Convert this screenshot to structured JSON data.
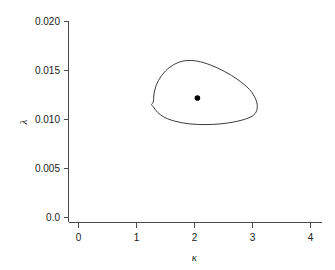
{
  "chart_data": {
    "type": "line",
    "title": "",
    "subtitle": "",
    "xlabel": "κ",
    "ylabel": "λ",
    "xlim": [
      -0.17,
      4.35
    ],
    "ylim": [
      -0.0005,
      0.0205
    ],
    "grid": false,
    "legend": null,
    "x_ticks": [
      0,
      1,
      2,
      3,
      4
    ],
    "x_tick_labels": [
      "0",
      "1",
      "2",
      "3",
      "4"
    ],
    "y_ticks": [
      0.0,
      0.005,
      0.01,
      0.015,
      0.02
    ],
    "y_tick_labels": [
      "0.0",
      "0.005",
      "0.010",
      "0.015",
      "0.020"
    ],
    "series": [
      {
        "name": "confidence-region-contour",
        "type": "closed-contour",
        "stroke": "#3a3a3a",
        "x": [
          1.29,
          1.31,
          1.38,
          1.5,
          1.66,
          1.84,
          2.05,
          2.28,
          2.52,
          2.75,
          2.95,
          3.06,
          3.08,
          3.02,
          2.88,
          2.68,
          2.44,
          2.18,
          1.92,
          1.68,
          1.49,
          1.36,
          1.29,
          1.26,
          1.29
        ],
        "y": [
          0.0118,
          0.0129,
          0.014,
          0.01495,
          0.01565,
          0.016,
          0.01595,
          0.01555,
          0.0149,
          0.01405,
          0.01305,
          0.012,
          0.0111,
          0.01045,
          0.01005,
          0.00975,
          0.00955,
          0.00948,
          0.00955,
          0.0098,
          0.0102,
          0.01075,
          0.0113,
          0.01155,
          0.0118
        ]
      },
      {
        "name": "point-estimate",
        "type": "scatter",
        "marker": "filled-circle",
        "color": "#000000",
        "x": [
          2.05
        ],
        "y": [
          0.0122
        ]
      }
    ]
  },
  "axes": {
    "x_axis_name": "kappa-axis",
    "y_axis_name": "lambda-axis"
  },
  "colors": {
    "background": "#ffffff",
    "axis": "#4a4a4a",
    "contour": "#3a3a3a",
    "point": "#000000",
    "text": "#1a1a1a"
  }
}
